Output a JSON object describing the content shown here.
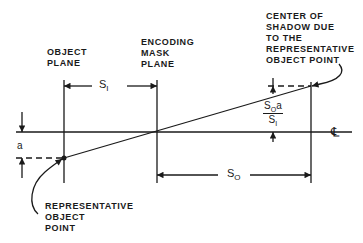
{
  "diagram": {
    "labels": {
      "object_plane": "OBJECT\nPLANE",
      "encoding_mask_plane": "ENCODING\nMASK\nPLANE",
      "center_of_shadow": "CENTER OF\nSHADOW DUE\nTO THE\nREPRESENTATIVE\nOBJECT POINT",
      "representative_object_point": "REPRESENTATIVE\nOBJECT\nPOINT"
    },
    "dimensions": {
      "s_i": {
        "base": "S",
        "sub": "I"
      },
      "s_o": {
        "base": "S",
        "sub": "O"
      },
      "a": "a",
      "shadow_offset": {
        "num_base": "S",
        "num_sub": "O",
        "num_tail": "a",
        "den_base": "S",
        "den_sub": "I"
      }
    },
    "centerline_symbol": "℄",
    "colors": {
      "line": "#1a1a1a",
      "background": "#ffffff"
    }
  }
}
